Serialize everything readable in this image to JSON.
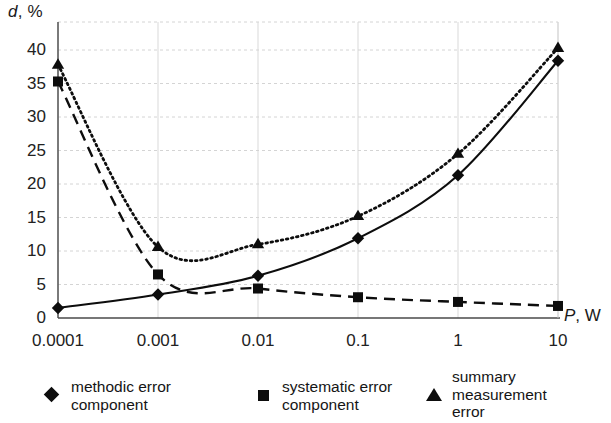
{
  "chart_data": {
    "type": "line",
    "title": "",
    "subtitle": "",
    "xlabel": "P, W",
    "xlabel_italic_part": "P",
    "xlabel_rest": ", W",
    "ylabel": "d, %",
    "ylabel_italic_part": "d",
    "ylabel_rest": ", %",
    "xscale": "log",
    "yscale": "linear",
    "xlim": [
      0.0001,
      10
    ],
    "ylim": [
      0,
      42
    ],
    "grid": true,
    "legend_position": "bottom",
    "x": [
      0.0001,
      0.001,
      0.01,
      0.1,
      1,
      10
    ],
    "xtick_labels": [
      "0.0001",
      "0.001",
      "0.01",
      "0.1",
      "1",
      "10"
    ],
    "ytick_labels": [
      "0",
      "5",
      "10",
      "15",
      "20",
      "25",
      "30",
      "35",
      "40"
    ],
    "ytick_values": [
      0,
      5,
      10,
      15,
      20,
      25,
      30,
      35,
      40
    ],
    "series": [
      {
        "name": "methodic error component",
        "marker": "diamond",
        "linestyle": "solid",
        "color": "#0d0d0d",
        "values": [
          1.5,
          3.5,
          6.3,
          11.9,
          21.3,
          38.4
        ]
      },
      {
        "name": "systematic error component",
        "marker": "square",
        "linestyle": "dashed",
        "color": "#0d0d0d",
        "values": [
          35.3,
          6.5,
          4.4,
          3.1,
          2.4,
          1.8
        ]
      },
      {
        "name": "summary measurement error",
        "marker": "triangle",
        "linestyle": "dotted",
        "color": "#0d0d0d",
        "values": [
          37.8,
          10.6,
          11.0,
          15.2,
          24.5,
          40.3
        ]
      }
    ]
  },
  "legend": {
    "entries": [
      {
        "label": "methodic error\ncomponent",
        "marker": "diamond"
      },
      {
        "label": "systematic error\ncomponent",
        "marker": "square"
      },
      {
        "label": "summary\nmeasurement\nerror",
        "marker": "triangle"
      }
    ]
  }
}
